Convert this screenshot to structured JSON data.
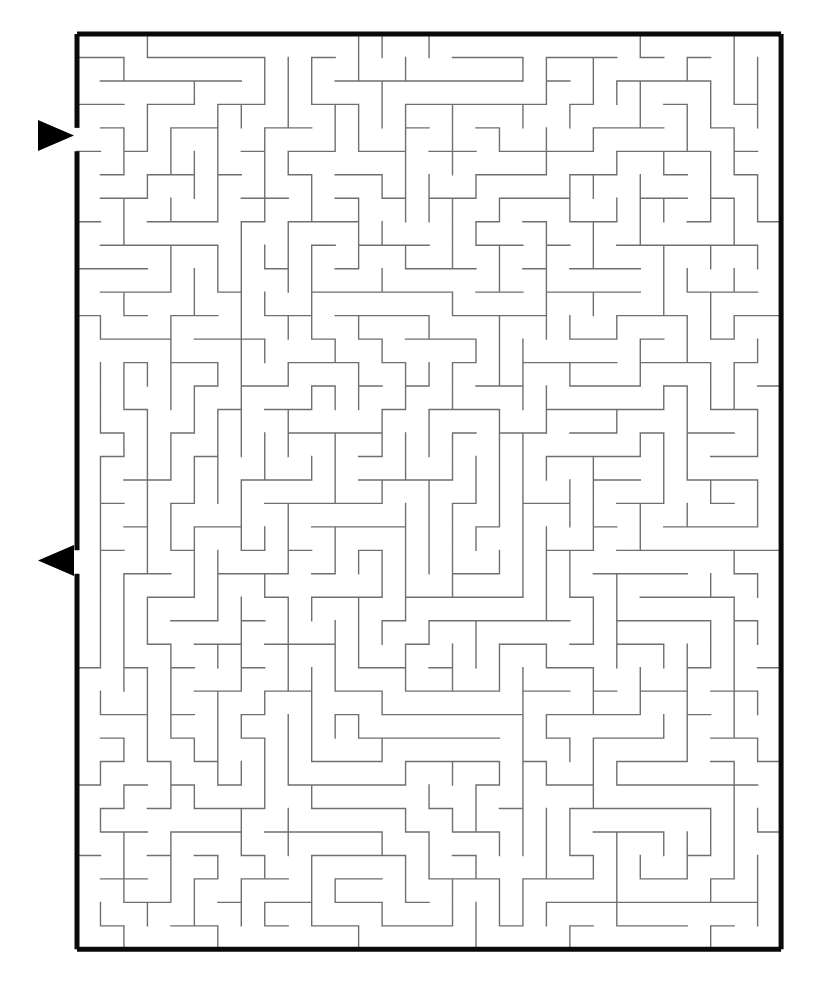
{
  "figure": {
    "kind": "maze-puzzle",
    "background_color": "#ffffff",
    "border_color": "#0a0a0a",
    "wall_color": "#6f6f6f",
    "marker_color": "#000000"
  },
  "maze": {
    "columns": 30,
    "rows": 39,
    "cell_size": 23.47,
    "origin_x": 77,
    "origin_y": 34,
    "width": 704,
    "height": 915,
    "border_thickness": 5,
    "wall_thickness": 1.4,
    "seed": 20240517
  },
  "markers": {
    "entrance": {
      "label": "entrance-arrow",
      "direction": "right",
      "x": 38,
      "y": 120,
      "size": 31,
      "opening_row": 4
    },
    "exit": {
      "label": "exit-arrow",
      "direction": "left",
      "x": 38,
      "y": 545,
      "size": 31,
      "opening_row": 22
    }
  }
}
